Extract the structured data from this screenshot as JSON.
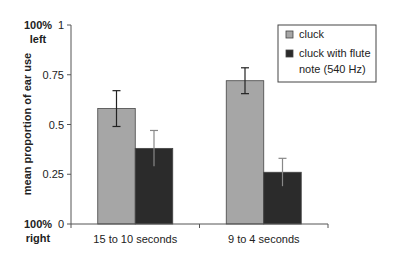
{
  "chart_data": {
    "type": "bar",
    "title": "",
    "xlabel": "",
    "ylabel": "mean proportion of ear use",
    "ylim": [
      0,
      1
    ],
    "yticks": [
      0,
      0.25,
      0.5,
      0.75,
      1
    ],
    "ytick_labels": [
      "0",
      "0.25",
      "0.5",
      "0.75",
      "1"
    ],
    "y_annotations": {
      "top": [
        "100%",
        "left"
      ],
      "bottom": [
        "100%",
        "right"
      ]
    },
    "categories": [
      "15 to 10 seconds",
      "9 to 4 seconds"
    ],
    "series": [
      {
        "name": "cluck",
        "color": "#a6a6a6",
        "values": [
          0.58,
          0.72
        ],
        "error": [
          0.09,
          0.065
        ]
      },
      {
        "name": "cluck with flute note (540 Hz)",
        "color": "#2b2b2b",
        "values": [
          0.38,
          0.26
        ],
        "error": [
          0.09,
          0.07
        ]
      }
    ],
    "legend": {
      "position": "top-right",
      "entries": [
        {
          "lines": [
            "cluck"
          ]
        },
        {
          "lines": [
            "cluck with flute",
            "note (540 Hz)"
          ]
        }
      ]
    },
    "grid": false
  }
}
